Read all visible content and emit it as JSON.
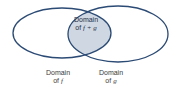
{
  "diagram": {
    "type": "venn",
    "colors": {
      "outline": "#2b4a74",
      "intersection_fill": "#cfd8e2",
      "text": "#3a3a3a"
    },
    "sets": [
      {
        "id": "f",
        "label_line1": "Domain",
        "label_line2_prefix": "of ",
        "label_var": "f"
      },
      {
        "id": "g",
        "label_line1": "Domain",
        "label_line2_prefix": "of ",
        "label_var": "g"
      }
    ],
    "intersection": {
      "label_line1": "Domain",
      "label_line2_prefix": "of ",
      "label_expr": "f + g"
    }
  }
}
